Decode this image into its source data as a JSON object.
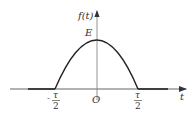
{
  "diagram": {
    "type": "function-plot",
    "y_axis_label": "f(t)",
    "x_axis_label": "t",
    "peak_label": "E",
    "origin_label": "O",
    "left_tick": {
      "sign": "-",
      "numerator": "τ",
      "denominator": "2"
    },
    "right_tick": {
      "sign": "",
      "numerator": "τ",
      "denominator": "2"
    },
    "colors": {
      "axis": "#555555",
      "curve": "#222222",
      "text": "#333333"
    }
  }
}
